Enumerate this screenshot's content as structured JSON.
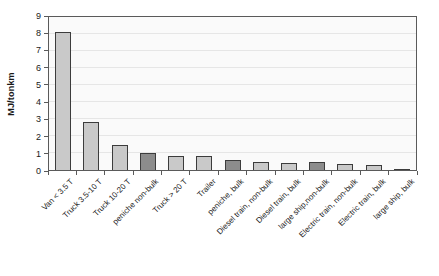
{
  "chart_data": {
    "type": "bar",
    "title": "",
    "ylabel": "MJ/tonkm",
    "xlabel": "",
    "ylim": [
      0,
      9
    ],
    "yticks": [
      0,
      1,
      2,
      3,
      4,
      5,
      6,
      7,
      8,
      9
    ],
    "grid": true,
    "legend": false,
    "categories": [
      "Van < 3.5 T",
      "Truck 3.5-10 T",
      "Truck 10-20 T",
      "peniche non-bulk",
      "Truck > 20 T",
      "Trailer",
      "peniche, bulk",
      "Diesel train, non-bulk",
      "Diesel train, bulk",
      "large ship,non-bulk",
      "Electric train, non-bulk",
      "Electric train, bulk",
      "large ship, bulk"
    ],
    "values": [
      8.1,
      2.8,
      1.5,
      1.0,
      0.8,
      0.85,
      0.6,
      0.5,
      0.4,
      0.45,
      0.35,
      0.3,
      0.08
    ],
    "bar_shades": [
      "light",
      "light",
      "light",
      "dark",
      "light",
      "light",
      "dark",
      "light",
      "light",
      "dark",
      "light",
      "light",
      "dark"
    ],
    "palette": {
      "bar_light": "#c9c9c9",
      "bar_dark": "#8c8c8c",
      "bar_border": "#3c3c3c",
      "axis": "#5a5a5a",
      "grid": "#e6e6e6",
      "plot_bg": "#fafafa",
      "page_bg": "#ffffff",
      "text": "#1a1a1a"
    }
  }
}
